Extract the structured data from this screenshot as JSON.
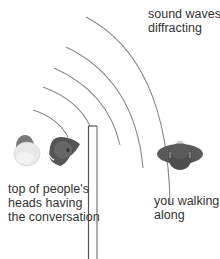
{
  "labels": {
    "waves": "sound waves\ndiffracting",
    "speakers": "top of people's\nheads having\nthe conversation",
    "listener": "you walking\nalong"
  },
  "colors": {
    "arc": "#888888",
    "wall": "#555555",
    "head_dark": "#555555",
    "head_light": "#e6e6e6",
    "text": "#333333"
  },
  "figures": {
    "speaker_1": "light-head",
    "speaker_2": "dark-head",
    "listener": "dark-head",
    "wall": "thin-wall",
    "wave_count": 5
  }
}
